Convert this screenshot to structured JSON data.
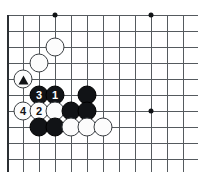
{
  "board": {
    "kind": "go-board-diagram",
    "origin_x": 7,
    "origin_y": 15,
    "spacing": 16,
    "cols": 12,
    "rows": 10,
    "line_color": "#555a5e",
    "edge_color": "#2b2f33",
    "background_color": "#ffffff",
    "black_color": "#111316",
    "white_color": "#fcfcfc",
    "star_points": [
      {
        "col": 3,
        "row": 0
      },
      {
        "col": 9,
        "row": 0
      },
      {
        "col": 9,
        "row": 6
      }
    ],
    "edges": {
      "left": true,
      "bottom": true,
      "top": false,
      "right": false
    },
    "stones": [
      {
        "col": 3,
        "row": 2,
        "color": "white",
        "label": "",
        "mark": ""
      },
      {
        "col": 2,
        "row": 3,
        "color": "white",
        "label": "",
        "mark": ""
      },
      {
        "col": 1,
        "row": 4,
        "color": "white",
        "label": "",
        "mark": "triangle"
      },
      {
        "col": 2,
        "row": 5,
        "color": "black",
        "label": "3",
        "mark": ""
      },
      {
        "col": 3,
        "row": 5,
        "color": "black",
        "label": "1",
        "mark": ""
      },
      {
        "col": 5,
        "row": 5,
        "color": "black",
        "label": "",
        "mark": ""
      },
      {
        "col": 1,
        "row": 6,
        "color": "white",
        "label": "4",
        "mark": ""
      },
      {
        "col": 2,
        "row": 6,
        "color": "white",
        "label": "2",
        "mark": ""
      },
      {
        "col": 3,
        "row": 6,
        "color": "white",
        "label": "",
        "mark": ""
      },
      {
        "col": 4,
        "row": 6,
        "color": "black",
        "label": "",
        "mark": ""
      },
      {
        "col": 5,
        "row": 6,
        "color": "black",
        "label": "",
        "mark": ""
      },
      {
        "col": 2,
        "row": 7,
        "color": "black",
        "label": "",
        "mark": ""
      },
      {
        "col": 3,
        "row": 7,
        "color": "black",
        "label": "",
        "mark": ""
      },
      {
        "col": 4,
        "row": 7,
        "color": "white",
        "label": "",
        "mark": ""
      },
      {
        "col": 5,
        "row": 7,
        "color": "white",
        "label": "",
        "mark": ""
      },
      {
        "col": 6,
        "row": 7,
        "color": "white",
        "label": "",
        "mark": ""
      }
    ]
  }
}
